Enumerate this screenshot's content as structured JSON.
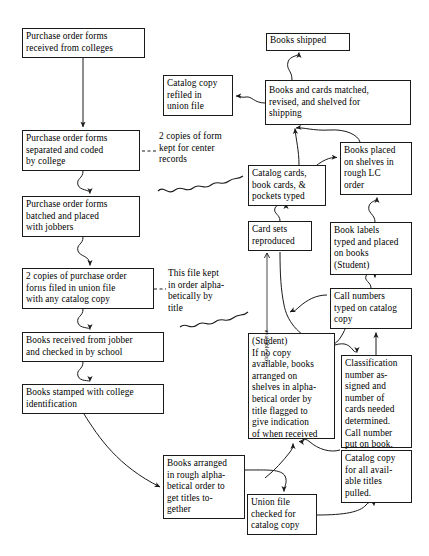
{
  "diagram": {
    "type": "flowchart",
    "width": 429,
    "height": 556,
    "stroke_color": "#1a1a1a",
    "background_color": "#ffffff",
    "nodes": [
      {
        "id": "po-received",
        "label": "Purchase order forms\nreceived from colleges",
        "x": 22,
        "y": 28,
        "w": 123,
        "h": 30
      },
      {
        "id": "po-separated",
        "label": "Purchase order forms\nseparated and coded\nby college",
        "x": 22,
        "y": 130,
        "w": 118,
        "h": 41
      },
      {
        "id": "po-batched",
        "label": "Purchase order forms\nbatched and placed\nwith jobbers",
        "x": 22,
        "y": 196,
        "w": 118,
        "h": 41
      },
      {
        "id": "po-two-copies",
        "label": "2 copies of purchase order\nforııs filed in union file\nwith any catalog copy",
        "x": 22,
        "y": 268,
        "w": 132,
        "h": 41
      },
      {
        "id": "books-received",
        "label": "Books received from jobber\nand checked in by school",
        "x": 22,
        "y": 332,
        "w": 142,
        "h": 30
      },
      {
        "id": "books-stamped",
        "label": "Books stamped with college\nidentification",
        "x": 22,
        "y": 384,
        "w": 142,
        "h": 30
      },
      {
        "id": "books-arranged",
        "label": "Books arranged\nin rough alpha-\nbetical order to\nget titles to-\ngether",
        "x": 163,
        "y": 455,
        "w": 82,
        "h": 64
      },
      {
        "id": "union-file-check",
        "label": "Union file\nchecked for\ncatalog copy",
        "x": 247,
        "y": 494,
        "w": 70,
        "h": 41
      },
      {
        "id": "catalog-refiled",
        "label": "Catalog copy\nrefiled in\nunion file",
        "x": 163,
        "y": 75,
        "w": 70,
        "h": 41
      },
      {
        "id": "books-shipped",
        "label": "Books shipped",
        "x": 266,
        "y": 33,
        "w": 84,
        "h": 18
      },
      {
        "id": "books-matched",
        "label": "Books and cards matched,\nrevised,  and shelved for\nshipping",
        "x": 265,
        "y": 80,
        "w": 146,
        "h": 45
      },
      {
        "id": "books-placed",
        "label": "Books placed\non shelves in\nrough LC\norder",
        "x": 340,
        "y": 142,
        "w": 72,
        "h": 53
      },
      {
        "id": "catalog-cards",
        "label": "Catalog cards,\nbook cards, &\npockets typed",
        "x": 248,
        "y": 165,
        "w": 78,
        "h": 41
      },
      {
        "id": "card-sets",
        "label": "Card sets\nreproduced",
        "x": 248,
        "y": 221,
        "w": 64,
        "h": 30
      },
      {
        "id": "book-labels",
        "label": "Book labels\ntyped and placed\non books\n(Student)",
        "x": 330,
        "y": 222,
        "w": 82,
        "h": 53
      },
      {
        "id": "call-numbers",
        "label": "Call numbers\ntyped on catalog\ncopy",
        "x": 330,
        "y": 288,
        "w": 82,
        "h": 41
      },
      {
        "id": "student-no-copy",
        "label": "(Student)\nIf no copy\navailable, books\narranged on\nshelves in alpha-\nbetical order by\ntitle flagged to\ngive indication\nof when received",
        "x": 248,
        "y": 333,
        "w": 87,
        "h": 106
      },
      {
        "id": "classification",
        "label": "Classification\nnumber as-\nsigned and\nnumber of\ncards needed\ndetermined.\nCall number\nput on book.",
        "x": 341,
        "y": 355,
        "w": 71,
        "h": 93
      },
      {
        "id": "catalog-pulled",
        "label": "Catalog copy\nfor all avail-\nable titles\npulled.",
        "x": 341,
        "y": 450,
        "w": 71,
        "h": 53
      }
    ],
    "annotations": [
      {
        "id": "center-records",
        "label": "2 copies of form\nkept for center\nrecords",
        "x": 159,
        "y": 131
      },
      {
        "id": "file-order",
        "label": "This file kept\nin order alpha-\nbetically by\ntitle",
        "x": 168,
        "y": 268
      }
    ],
    "vertical_labels": [
      {
        "id": "available-copy",
        "label": "available copy",
        "x": 268,
        "y": 330
      }
    ]
  }
}
